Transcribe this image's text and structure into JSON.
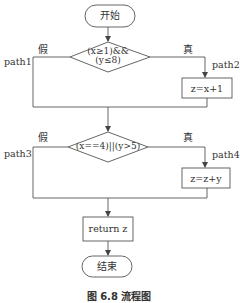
{
  "diagram": {
    "type": "flowchart",
    "start": {
      "label": "开始"
    },
    "decision1": {
      "line1": "(x≥1)&&",
      "line2": "(y≤8)",
      "false_label": "假",
      "true_label": "真",
      "false_path": "path1",
      "true_path": "path2"
    },
    "process1": {
      "label": "z=x+1"
    },
    "decision2": {
      "label": "(x==4)||(y>5)",
      "false_label": "假",
      "true_label": "真",
      "false_path": "path3",
      "true_path": "path4"
    },
    "process2": {
      "label": "z=z+y"
    },
    "return_box": {
      "label": "return z"
    },
    "end": {
      "label": "结束"
    },
    "caption": "图 6.8   流程图"
  },
  "colors": {
    "stroke": "#555555",
    "text": "#333333",
    "background": "#ffffff"
  }
}
